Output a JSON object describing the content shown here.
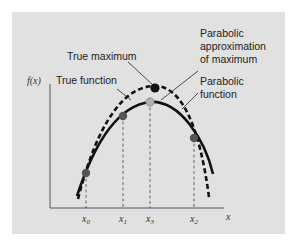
{
  "diagram": {
    "labels": {
      "true_maximum": "True maximum",
      "true_function": "True function",
      "parabolic_approx_line1": "Parabolic",
      "parabolic_approx_line2": "approximation",
      "parabolic_approx_line3": "of maximum",
      "parabolic_function_line1": "Parabolic",
      "parabolic_function_line2": "function"
    },
    "axes": {
      "y_label": "f(x)",
      "x_label": "x",
      "ticks": [
        {
          "base": "x",
          "sub": "0"
        },
        {
          "base": "x",
          "sub": "1"
        },
        {
          "base": "x",
          "sub": "3"
        },
        {
          "base": "x",
          "sub": "2"
        }
      ]
    },
    "colors": {
      "panel": "#e1e1e1",
      "curve": "#111111",
      "point_fill": "#555555",
      "estimated_max_fill": "#b0b0b0",
      "true_max_fill": "#111111"
    }
  }
}
